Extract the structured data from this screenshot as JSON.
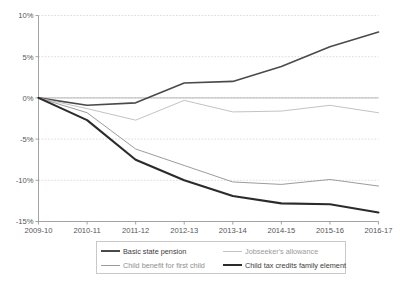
{
  "chart_data": {
    "type": "line",
    "title": "",
    "subtitle": "",
    "xlabel": "",
    "ylabel": "",
    "categories": [
      "2009-10",
      "2010-11",
      "2011-12",
      "2012-13",
      "2013-14",
      "2014-15",
      "2015-16",
      "2016-17"
    ],
    "ylim": [
      -15,
      10
    ],
    "yticks": [
      10,
      5,
      0,
      -5,
      -10,
      -15
    ],
    "ytick_labels": [
      "10%",
      "5%",
      "0%",
      "-5%",
      "-10%",
      "-15%"
    ],
    "grid": true,
    "legend_position": "bottom",
    "series": [
      {
        "name": "Basic state pension",
        "color": "#4a4a4a",
        "width": 1.6,
        "values": [
          0.0,
          -0.9,
          -0.6,
          1.8,
          2.0,
          3.8,
          6.2,
          8.0
        ]
      },
      {
        "name": "Jobseeker's allowance",
        "color": "#c3c3c3",
        "width": 1.0,
        "values": [
          0.0,
          -1.3,
          -2.7,
          -0.3,
          -1.7,
          -1.6,
          -0.9,
          -1.8
        ]
      },
      {
        "name": "Child benefit for first child",
        "color": "#9c9c9c",
        "width": 1.0,
        "values": [
          0.0,
          -1.8,
          -6.2,
          -8.2,
          -10.2,
          -10.5,
          -9.9,
          -10.7
        ]
      },
      {
        "name": "Child tax credits family element",
        "color": "#2b2b2b",
        "width": 2.1,
        "values": [
          0.0,
          -2.7,
          -7.5,
          -10.0,
          -11.9,
          -12.8,
          -12.9,
          -13.9
        ]
      }
    ]
  },
  "legend": {
    "items": [
      {
        "label": "Basic state pension"
      },
      {
        "label": "Jobseeker's allowance"
      },
      {
        "label": "Child benefit for first child"
      },
      {
        "label": "Child tax credits family element"
      }
    ]
  }
}
